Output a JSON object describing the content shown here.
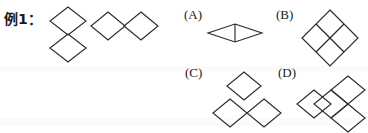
{
  "page": {
    "background_color": "#ffffff",
    "ink_color": "#2b2b2b",
    "width": 368,
    "height": 133
  },
  "prompt": {
    "label": "例1：",
    "name": "example-1"
  },
  "example_figures": [
    {
      "id": "example-figure-1",
      "description": "two diamonds stacked vertically meeting at a shared vertex",
      "tile_count": 2,
      "tiles": [
        {
          "cx": 0,
          "cy": -14
        },
        {
          "cx": 0,
          "cy": 14
        }
      ]
    },
    {
      "id": "example-figure-2",
      "description": "two diamonds placed side by side meeting at a shared vertex",
      "tile_count": 2,
      "tiles": [
        {
          "cx": -14,
          "cy": 0
        },
        {
          "cx": 14,
          "cy": 0
        }
      ]
    }
  ],
  "options": [
    {
      "letter": "(A)",
      "name": "option-a",
      "description": "a wide flattened rhombus split by a vertical line into two triangles",
      "tile_count": 2,
      "shape": "flat-rhombus-with-vertical-divider"
    },
    {
      "letter": "(B)",
      "name": "option-b",
      "description": "a large diamond subdivided into four small diamonds",
      "tile_count": 4,
      "shape": "two-by-two-diamond-block",
      "tiles": [
        {
          "cx": 0,
          "cy": -14
        },
        {
          "cx": -14,
          "cy": 0
        },
        {
          "cx": 14,
          "cy": 0
        },
        {
          "cx": 0,
          "cy": 14
        }
      ]
    },
    {
      "letter": "(C)",
      "name": "option-c",
      "description": "one diamond on top, two diamonds side by side below",
      "tile_count": 3,
      "shape": "diamond-over-pair",
      "tiles": [
        {
          "cx": 14,
          "cy": -28
        },
        {
          "cx": 0,
          "cy": 0
        },
        {
          "cx": 28,
          "cy": 0
        }
      ]
    },
    {
      "letter": "(D)",
      "name": "option-d",
      "description": "four diamonds in an offset cross arrangement",
      "tile_count": 4,
      "shape": "offset-cross",
      "tiles": [
        {
          "cx": 14,
          "cy": -14
        },
        {
          "cx": -14,
          "cy": 0
        },
        {
          "cx": 0,
          "cy": 0
        },
        {
          "cx": 14,
          "cy": 14
        }
      ]
    }
  ]
}
